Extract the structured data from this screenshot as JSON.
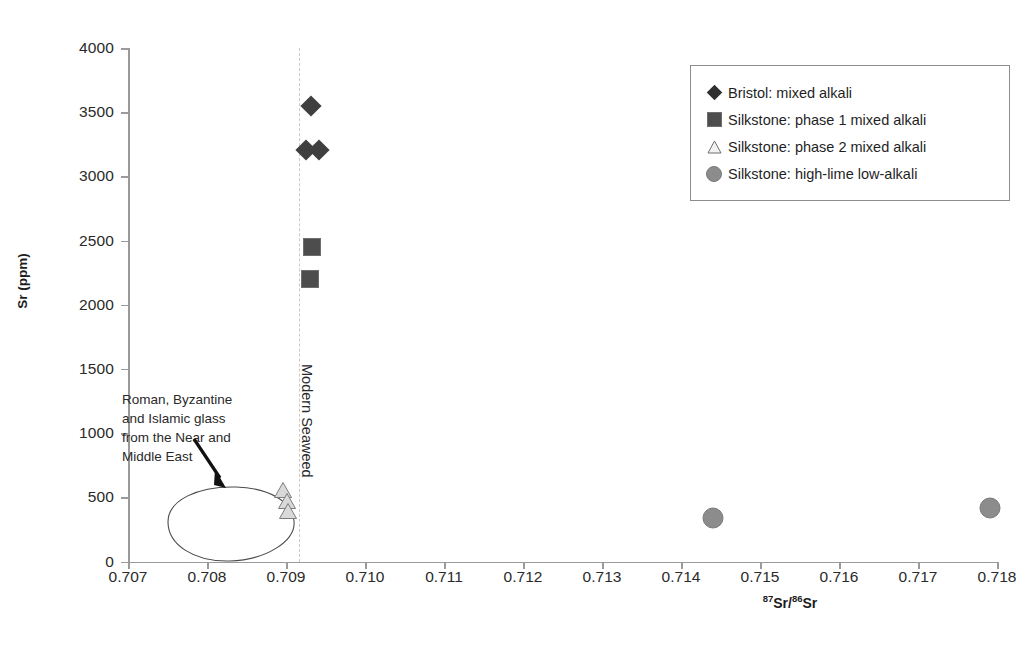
{
  "chart_data": {
    "type": "scatter",
    "title": "",
    "xlabel": "87Sr/86Sr",
    "xlabel_parts": {
      "sup1": "87",
      "mid": "Sr/",
      "sup2": "86",
      "end": "Sr"
    },
    "ylabel": "Sr (ppm)",
    "xlim": [
      0.707,
      0.718
    ],
    "ylim": [
      0,
      4000
    ],
    "xticks": [
      "0.707",
      "0.708",
      "0.709",
      "0.710",
      "0.711",
      "0.712",
      "0.713",
      "0.714",
      "0.715",
      "0.716",
      "0.717",
      "0.718"
    ],
    "xtick_values": [
      0.707,
      0.708,
      0.709,
      0.71,
      0.711,
      0.712,
      0.713,
      0.714,
      0.715,
      0.716,
      0.717,
      0.718
    ],
    "yticks": [
      "0",
      "500",
      "1000",
      "1500",
      "2000",
      "2500",
      "3000",
      "3500",
      "4000"
    ],
    "ytick_values": [
      0,
      500,
      1000,
      1500,
      2000,
      2500,
      3000,
      3500,
      4000
    ],
    "grid": false,
    "legend_position": "top-right",
    "series": [
      {
        "name": "Bristol: mixed alkali",
        "marker": "diamond",
        "color": "#3f3f3f",
        "points": [
          {
            "x": 0.70932,
            "y": 3550
          },
          {
            "x": 0.70925,
            "y": 3205
          },
          {
            "x": 0.70942,
            "y": 3205
          }
        ]
      },
      {
        "name": "Silkstone: phase 1 mixed alkali",
        "marker": "square",
        "color": "#4d4d4d",
        "points": [
          {
            "x": 0.70933,
            "y": 2450
          },
          {
            "x": 0.70931,
            "y": 2200
          }
        ]
      },
      {
        "name": "Silkstone: phase 2 mixed alkali",
        "marker": "triangle",
        "color": "#d6d6d6",
        "points": [
          {
            "x": 0.70896,
            "y": 560
          },
          {
            "x": 0.70901,
            "y": 470
          },
          {
            "x": 0.70903,
            "y": 390
          }
        ]
      },
      {
        "name": "Silkstone: high-lime low-alkali",
        "marker": "circle",
        "color": "#8c8c8c",
        "points": [
          {
            "x": 0.71441,
            "y": 340
          },
          {
            "x": 0.71791,
            "y": 415
          }
        ]
      }
    ],
    "annotations": [
      {
        "name": "near-east-glass-field",
        "text": "Roman, Byzantine\nand Islamic glass\nfrom the Near and\nMiddle East",
        "shape": "ellipse-outline"
      },
      {
        "name": "modern-seaweed-line",
        "text": "Modern Seaweed",
        "x": 0.70933,
        "style": "dashed-vertical"
      }
    ]
  },
  "legend": {
    "items": [
      {
        "label": "Bristol: mixed alkali",
        "marker": "diamond"
      },
      {
        "label": "Silkstone: phase 1 mixed alkali",
        "marker": "square"
      },
      {
        "label": "Silkstone: phase 2 mixed alkali",
        "marker": "triangle"
      },
      {
        "label": "Silkstone: high-lime low-alkali",
        "marker": "circle"
      }
    ]
  },
  "colors": {
    "axis": "#9a9a9a",
    "text": "#2a2a2a",
    "diamond": "#3f3f3f",
    "square": "#4d4d4d",
    "triangle_fill": "#d6d6d6",
    "triangle_stroke": "#8a8a8a",
    "circle": "#8c8c8c",
    "guide_line": "#c9c9c9",
    "background": "#ffffff"
  }
}
